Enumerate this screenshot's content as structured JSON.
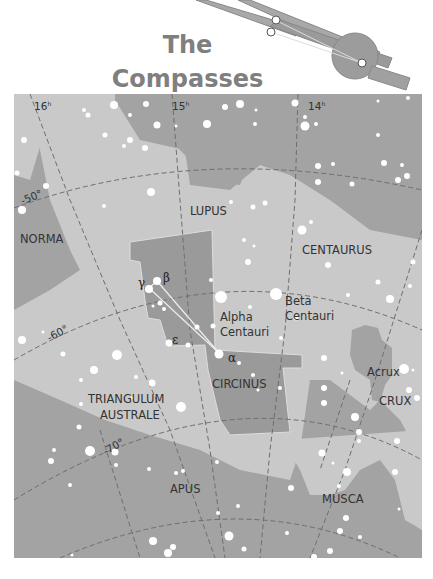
{
  "title": {
    "line1": "The",
    "line2": "Compasses"
  },
  "colors": {
    "background": "#ffffff",
    "light_region": "#c9c9c9",
    "mid_region": "#a3a3a3",
    "highlight_constellation": "#8a8a8a",
    "grid_line": "#6e6e6e",
    "star": "#ffffff",
    "title": "#7f7f7f",
    "compass_icon": "#9a9a9a"
  },
  "ra_labels": [
    {
      "text": "16",
      "sup": "h"
    },
    {
      "text": "15",
      "sup": "h"
    },
    {
      "text": "14",
      "sup": "h"
    }
  ],
  "dec_labels": [
    "-50°",
    "-60°",
    "-70°"
  ],
  "constellations": [
    "NORMA",
    "LUPUS",
    "CENTAURUS",
    "CIRCINUS",
    "TRIANGULUM",
    "AUSTRALE",
    "CRUX",
    "APUS",
    "MUSCA"
  ],
  "stars": {
    "alpha_centauri": {
      "line1": "Alpha",
      "line2": "Centauri"
    },
    "beta_centauri": {
      "line1": "Beta",
      "line2": "Centauri"
    },
    "acrux": "Acrux"
  },
  "greek_letters": {
    "alpha": "α",
    "beta": "β",
    "gamma": "γ",
    "epsilon": "ε"
  }
}
